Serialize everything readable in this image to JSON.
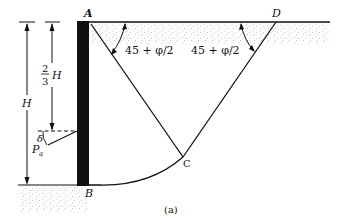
{
  "figure": {
    "caption": "(a)",
    "points": {
      "A": "A",
      "B": "B",
      "C": "C",
      "D": "D"
    },
    "angle_label_left": "45 + φ/2",
    "angle_label_right": "45 + φ/2",
    "dimension_total": "H",
    "dimension_fraction_num": "2",
    "dimension_fraction_den": "3",
    "dimension_fraction_var": "H",
    "force_label": "P",
    "force_subscript": "a",
    "wall_friction_angle": "δ"
  },
  "colors": {
    "ink": "#111111",
    "soil_dots": "#555555",
    "background": "#ffffff"
  }
}
